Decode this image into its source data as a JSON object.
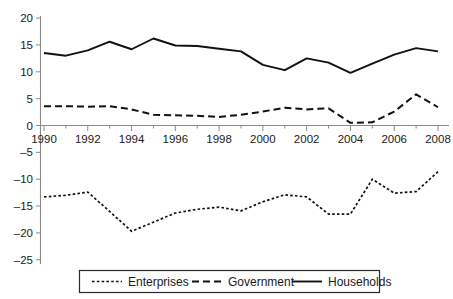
{
  "chart_data": {
    "type": "line",
    "title": "",
    "subtitle": "",
    "xlabel": "",
    "ylabel": "",
    "x": [
      1990,
      1991,
      1992,
      1993,
      1994,
      1995,
      1996,
      1997,
      1998,
      1999,
      2000,
      2001,
      2002,
      2003,
      2004,
      2005,
      2006,
      2007,
      2008
    ],
    "xlim": [
      1990,
      2008
    ],
    "ylim": [
      -25,
      20
    ],
    "xticks": [
      1990,
      1992,
      1994,
      1996,
      1998,
      2000,
      2002,
      2004,
      2006,
      2008
    ],
    "xtick_labels": [
      "1990",
      "1992",
      "1994",
      "1996",
      "1998",
      "2000",
      "2002",
      "2004",
      "2006",
      "2008"
    ],
    "yticks": [
      20,
      15,
      10,
      5,
      0,
      -5,
      -10,
      -15,
      -20,
      -25
    ],
    "ytick_labels": [
      "20",
      "15",
      "10",
      "5",
      "0",
      "–5",
      "–10",
      "–15",
      "–20",
      "–25"
    ],
    "grid": false,
    "legend_position": "bottom",
    "series": [
      {
        "name": "Enterprises",
        "style": "dotted",
        "values": [
          -13.3,
          -13.0,
          -12.4,
          -16.0,
          -19.7,
          -18.0,
          -16.3,
          -15.6,
          -15.2,
          -15.9,
          -14.2,
          -12.9,
          -13.3,
          -16.5,
          -16.5,
          -10.0,
          -12.6,
          -12.3,
          -8.6
        ]
      },
      {
        "name": "Government",
        "style": "dashed",
        "values": [
          3.6,
          3.6,
          3.5,
          3.6,
          3.0,
          2.0,
          1.9,
          1.8,
          1.6,
          2.0,
          2.6,
          3.3,
          3.0,
          3.2,
          0.5,
          0.6,
          2.6,
          5.8,
          3.4
        ]
      },
      {
        "name": "Households",
        "style": "solid",
        "values": [
          13.5,
          13.0,
          14.0,
          15.6,
          14.2,
          16.2,
          14.9,
          14.8,
          14.3,
          13.8,
          11.3,
          10.3,
          12.5,
          11.7,
          9.8,
          11.5,
          13.2,
          14.4,
          13.8
        ]
      }
    ],
    "colors": {
      "line": "#111111",
      "axis": "#8a8a8a",
      "text": "#1a1a1a",
      "background": "#ffffff"
    }
  },
  "legend": {
    "items": [
      {
        "label": "Enterprises",
        "style": "dotted"
      },
      {
        "label": "Government",
        "style": "dashed"
      },
      {
        "label": "Households",
        "style": "solid"
      }
    ]
  }
}
